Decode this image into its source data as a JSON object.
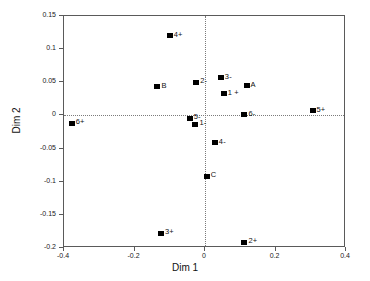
{
  "chart_data": {
    "type": "scatter",
    "title": "",
    "xlabel": "Dim 1",
    "ylabel": "Dim 2",
    "xlim": [
      -0.4,
      0.4
    ],
    "ylim": [
      -0.2,
      0.15
    ],
    "xticks": [
      "-0.4",
      "-0.2",
      "0",
      "0.2",
      "0.4"
    ],
    "xtick_values": [
      -0.4,
      -0.2,
      0,
      0.2,
      0.4
    ],
    "yticks": [
      "0.15",
      "0.1",
      "0.05",
      "0",
      "-0.05",
      "-0.1",
      "-0.15",
      "-0.2"
    ],
    "ytick_values": [
      0.15,
      0.1,
      0.05,
      0,
      -0.05,
      -0.1,
      -0.15,
      -0.2
    ],
    "grid": false,
    "reference_lines": {
      "horizontal": 0,
      "vertical": 0,
      "style": "dotted"
    },
    "legend": "none",
    "marker": {
      "shape": "square",
      "color": "#000000"
    },
    "points": [
      {
        "label": "4+",
        "x": -0.1,
        "y": 0.12
      },
      {
        "label": "B",
        "x": -0.135,
        "y": 0.043
      },
      {
        "label": "2-",
        "x": -0.025,
        "y": 0.05
      },
      {
        "label": "3-",
        "x": 0.045,
        "y": 0.057
      },
      {
        "label": "A",
        "x": 0.118,
        "y": 0.045
      },
      {
        "label": "1 +",
        "x": 0.053,
        "y": 0.033
      },
      {
        "label": "5+",
        "x": 0.305,
        "y": 0.007
      },
      {
        "label": "6-",
        "x": 0.112,
        "y": 0.001
      },
      {
        "label": "5-",
        "x": -0.043,
        "y": -0.004
      },
      {
        "label": "1-",
        "x": -0.027,
        "y": -0.013
      },
      {
        "label": "6+",
        "x": -0.378,
        "y": -0.012
      },
      {
        "label": "4-",
        "x": 0.028,
        "y": -0.041
      },
      {
        "label": "C",
        "x": 0.005,
        "y": -0.092
      },
      {
        "label": "3+",
        "x": -0.125,
        "y": -0.178
      },
      {
        "label": "2+",
        "x": 0.112,
        "y": -0.191
      }
    ]
  }
}
